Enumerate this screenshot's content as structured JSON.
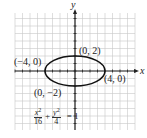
{
  "chart_data": {
    "type": "line",
    "title": "",
    "xlabel": "x",
    "ylabel": "y",
    "grid": true,
    "xlim": [
      -8,
      8
    ],
    "ylim": [
      -8,
      8
    ],
    "curve": {
      "kind": "ellipse",
      "center": [
        0,
        0
      ],
      "semi_major_x": 4,
      "semi_minor_y": 2,
      "equation": "x^2/16 + y^2/4 = 1"
    },
    "annotations": [
      {
        "point": [
          -4,
          0
        ],
        "text": "(−4, 0)"
      },
      {
        "point": [
          4,
          0
        ],
        "text": "(4, 0)"
      },
      {
        "point": [
          0,
          2
        ],
        "text": "(0, 2)"
      },
      {
        "point": [
          0,
          -2
        ],
        "text": "(0, −2)"
      }
    ]
  },
  "labels": {
    "x_axis": "x",
    "y_axis": "y",
    "p_left": "(−4, 0)",
    "p_right": "(4, 0)",
    "p_top": "(0, 2)",
    "p_bottom": "(0, −2)"
  },
  "equation": {
    "term1_num": "x",
    "term1_exp": "2",
    "term1_den": "16",
    "plus": "+",
    "term2_num": "y",
    "term2_exp": "2",
    "term2_den": "4",
    "rhs": "= 1"
  },
  "colors": {
    "grid": "#c8c8c8",
    "axis": "#222222",
    "curve": "#111111"
  }
}
